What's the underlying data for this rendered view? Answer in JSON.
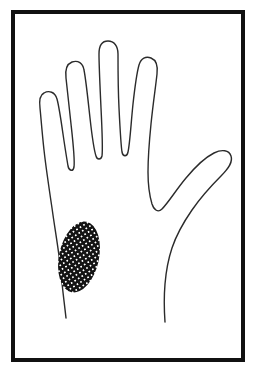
{
  "figure": {
    "background_color": "#ffffff",
    "ink_color": "#1a1a1a",
    "caption_text": "",
    "border": {
      "label": "figure border",
      "color": "#111111",
      "stroke_width": 4,
      "x": 13,
      "y": 12,
      "width": 230,
      "height": 348
    },
    "hand": {
      "label": "hand outline",
      "stroke_color": "#2b2b2b",
      "stroke_width": 1.4,
      "fill": "#ffffff",
      "outline_path": "M 66 318 C 64 300 62 286 61 272 C 59 252 55 230 52 208 C 49 188 46 168 44 150 C 42 132 41 118 40 108 C 39 100 40 95 44 93 C 49 90 55 92 57 99 C 59 106 61 120 63 134 C 65 148 67 160 68 166 C 69 171 73 172 74 167 C 75 159 73 142 71 124 C 69 105 67 88 66 78 C 65 70 67 64 72 62 C 78 60 83 63 84 70 C 86 80 88 100 90 118 C 92 136 94 150 96 156 C 97 160 101 160 102 156 C 103 148 102 128 101 108 C 100 86 99 66 99 54 C 99 46 102 41 108 41 C 114 41 118 46 118 54 C 118 66 118 88 119 108 C 120 128 121 146 122 152 C 123 157 127 157 128 152 C 130 143 131 123 133 104 C 135 86 137 72 139 65 C 141 58 146 56 151 58 C 156 60 158 66 157 74 C 156 84 153 104 151 124 C 149 144 148 160 148 172 C 148 182 149 194 152 204 C 154 210 158 213 162 209 C 168 203 176 190 186 178 C 196 166 206 157 214 153 C 222 149 229 150 231 156 C 233 162 229 168 221 176 C 212 185 201 197 192 210 C 183 223 176 236 172 248 C 168 260 166 272 165 284 C 164 296 164 308 165 322",
      "wrist_left_path": "M 66 318 C 65 310 64 304 63 298",
      "wrist_right_path": "M 165 322 C 165 316 165 312 165 308"
    },
    "shaded_region": {
      "label": "crosshatched hypothenar region",
      "pattern": "crosshatch-diagonal",
      "pattern_angle_degrees": 45,
      "pattern_spacing_px": 3,
      "fill_color": "#141414",
      "center_x": 79,
      "center_y": 257,
      "radius_x": 20,
      "radius_y": 36,
      "rotation_degrees": 12
    }
  }
}
